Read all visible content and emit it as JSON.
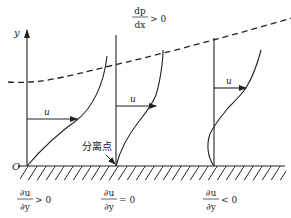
{
  "figure": {
    "pressure_gradient": {
      "numerator": "dp",
      "denominator": "dx",
      "relation": "> 0"
    },
    "axis_label_y": "y",
    "origin_label": "O",
    "velocity_label": "u",
    "separation_point_label": "分离点",
    "profiles": [
      {
        "id": "before-separation",
        "velocity_label": "u",
        "gradient": {
          "numerator": "∂u",
          "denominator": "∂y",
          "relation": "> 0"
        }
      },
      {
        "id": "at-separation",
        "velocity_label": "u",
        "gradient": {
          "numerator": "∂u",
          "denominator": "∂y",
          "relation": "= 0"
        }
      },
      {
        "id": "after-separation",
        "velocity_label": "u",
        "gradient": {
          "numerator": "∂u",
          "denominator": "∂y",
          "relation": "< 0"
        }
      }
    ],
    "colors": {
      "stroke": "#222222",
      "background": "#ffffff"
    }
  }
}
